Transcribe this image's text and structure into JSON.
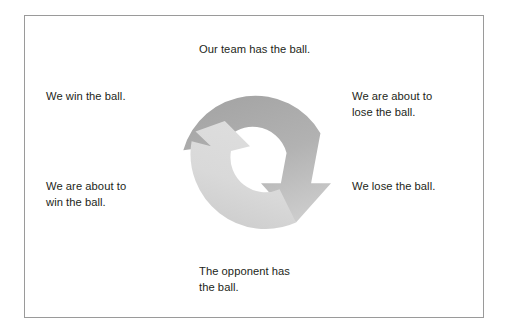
{
  "figure": {
    "type": "cycle-diagram",
    "border_color": "#9a9a9a",
    "background_color": "#ffffff",
    "text_color": "#231f20"
  },
  "diagram": {
    "name": "ball-possession-cycle",
    "shape": "two-arrow-ring",
    "arrows": [
      {
        "name": "outer-descending-arrow",
        "head": "down",
        "head_position": "right",
        "fill_from": "#a9a9a9",
        "fill_to": "#c9c9c9"
      },
      {
        "name": "outer-ascending-arrow",
        "head": "up",
        "head_position": "left",
        "fill_from": "#e2e2e2",
        "fill_to": "#cfcfcf"
      }
    ],
    "ring": {
      "outer_radius": 75,
      "inner_radius": 35,
      "center_x": 256,
      "center_y": 162
    }
  },
  "labels": {
    "top": "Our team has the ball.",
    "left_top": "We win the ball.",
    "right_top": "We are about to\nlose the ball.",
    "left_bottom": "We are about to\nwin the ball.",
    "right_bottom": "We lose the ball.",
    "bottom": "The opponent has\nthe ball."
  }
}
